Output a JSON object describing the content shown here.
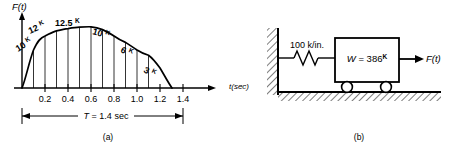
{
  "figure": {
    "panel_a": {
      "caption": "(a)",
      "y_axis_label": "F(t)",
      "x_axis_label": "t(sec)",
      "duration_label": "T = 1.4 sec",
      "curve_value_labels": [
        "10",
        "12",
        "12.5",
        "10",
        "6",
        "3"
      ],
      "curve_value_superscript": "K",
      "x_tick_labels": [
        "0.2",
        "0.4",
        "0.6",
        "0.8",
        "1.0",
        "1.2",
        "1.4"
      ]
    },
    "panel_b": {
      "caption": "(b)",
      "spring_label": "100 k/in.",
      "mass_label": "W = 386",
      "mass_label_superscript": "K",
      "force_label": "F(t)"
    }
  },
  "chart_data": {
    "type": "line",
    "title": "",
    "xlabel": "t(sec)",
    "ylabel": "F(t)",
    "xlim": [
      0,
      1.5
    ],
    "ylim": [
      0,
      14
    ],
    "grid": false,
    "legend": "none",
    "x_ticks": [
      0.2,
      0.4,
      0.6,
      0.8,
      1.0,
      1.2,
      1.4
    ],
    "x_tick_labels": [
      "0.2",
      "0.4",
      "0.6",
      "0.8",
      "1.0",
      "1.2",
      "1.4"
    ],
    "annotations": [
      {
        "text": "10K",
        "x": 0.1,
        "y": 10
      },
      {
        "text": "12K",
        "x": 0.2,
        "y": 12
      },
      {
        "text": "12.5K",
        "x": 0.3,
        "y": 12.5
      },
      {
        "text": "10K",
        "x": 0.4,
        "y": 10
      },
      {
        "text": "6K",
        "x": 0.5,
        "y": 6
      },
      {
        "text": "3K",
        "x": 0.6,
        "y": 3
      }
    ],
    "ordinate_stations": [
      0.05,
      0.1,
      0.15,
      0.2,
      0.25,
      0.3,
      0.35,
      0.4,
      0.45,
      0.5,
      0.55,
      0.6
    ],
    "series": [
      {
        "name": "F(t)",
        "x": [
          0.0,
          0.05,
          0.1,
          0.15,
          0.2,
          0.25,
          0.3,
          0.35,
          0.4,
          0.45,
          0.5,
          0.55,
          0.6,
          0.65,
          0.7
        ],
        "y": [
          0.0,
          5.8,
          10.0,
          11.4,
          12.0,
          12.4,
          12.5,
          11.7,
          10.0,
          8.2,
          6.0,
          4.5,
          3.0,
          1.5,
          0.0
        ]
      }
    ],
    "span_marker": {
      "label": "T = 1.4 sec",
      "from": 0.0,
      "to": 1.4
    }
  }
}
